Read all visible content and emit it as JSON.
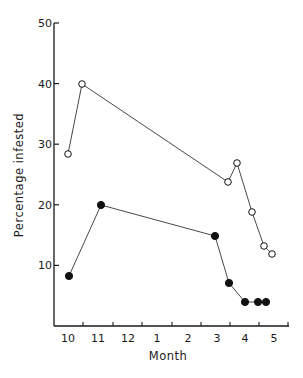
{
  "chart_data": {
    "type": "line",
    "title": "",
    "xlabel": "Month",
    "ylabel": "Percentage infested",
    "ylim": [
      0,
      50
    ],
    "yticks": [
      10,
      20,
      30,
      40,
      50
    ],
    "xtick_labels": [
      "10",
      "11",
      "12",
      "1",
      "2",
      "3",
      "4",
      "5"
    ],
    "grid": false,
    "legend": null,
    "series": [
      {
        "name": "open-circles",
        "marker": "open-circle",
        "points": [
          {
            "x": 10.0,
            "y": 24
          },
          {
            "x": 10.5,
            "y": 40
          },
          {
            "x": 2.4,
            "y": 24
          },
          {
            "x": 2.7,
            "y": 27
          },
          {
            "x": 3.2,
            "y": 19
          },
          {
            "x": 3.6,
            "y": 13
          },
          {
            "x": 3.9,
            "y": 12
          }
        ]
      },
      {
        "name": "filled-circles",
        "marker": "filled-circle",
        "points": [
          {
            "x": 10.0,
            "y": 13
          },
          {
            "x": 11.1,
            "y": 20
          },
          {
            "x": 2.9,
            "y": 15
          },
          {
            "x": 3.4,
            "y": 7
          },
          {
            "x": 3.9,
            "y": 4
          },
          {
            "x": 4.4,
            "y": 4
          },
          {
            "x": 4.7,
            "y": 4
          }
        ]
      }
    ]
  },
  "render": {
    "open_px": [
      [
        68,
        154
      ],
      [
        82,
        84
      ],
      [
        228,
        182
      ],
      [
        237,
        163
      ],
      [
        252,
        212
      ],
      [
        264,
        246
      ],
      [
        272,
        254
      ]
    ],
    "filled_px": [
      [
        69,
        276
      ],
      [
        101,
        205
      ],
      [
        215,
        236
      ],
      [
        229,
        283
      ],
      [
        245,
        302
      ],
      [
        258,
        302
      ],
      [
        266,
        302
      ]
    ]
  }
}
